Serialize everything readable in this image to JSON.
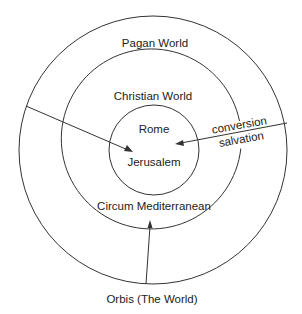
{
  "diagram": {
    "rings": [
      {
        "name": "outer",
        "label": "Pagan World"
      },
      {
        "name": "middle",
        "label": "Christian World"
      },
      {
        "name": "inner",
        "labels": [
          "Rome",
          "Jerusalem"
        ]
      }
    ],
    "middle_ring_lower_label": "Circum Mediterranean",
    "right_arrow_labels": [
      "conversion",
      "salvation"
    ],
    "bottom_caption": "Orbis (The World)",
    "colors": {
      "stroke": "#333333",
      "text": "#222222",
      "background": "#ffffff"
    }
  }
}
